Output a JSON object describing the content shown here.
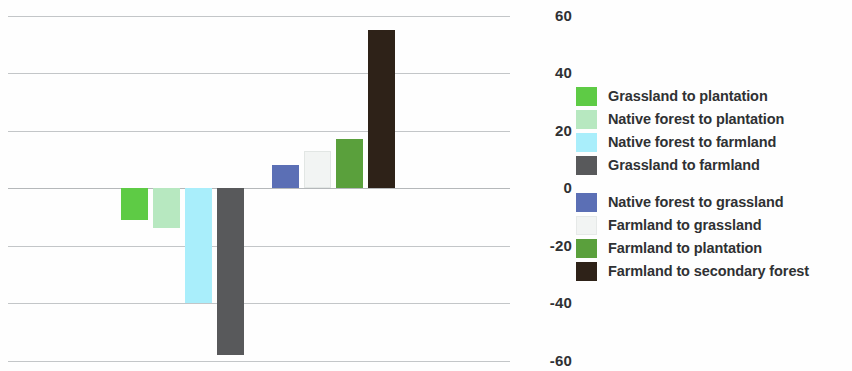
{
  "chart_data": {
    "type": "bar",
    "title": "",
    "subtitle": "",
    "xlabel": "",
    "ylabel": "",
    "ylim": [
      -60,
      60
    ],
    "grid": true,
    "legend_position": "right",
    "y_ticks": [
      "60",
      "40",
      "20",
      "0",
      "-20",
      "-40",
      "-60"
    ],
    "y_tick_values": [
      60,
      40,
      20,
      0,
      -20,
      -40,
      -60
    ],
    "categories": [
      "Grassland to plantation",
      "Native forest to plantation",
      "Native forest to farmland",
      "Grassland to farmland",
      "Native forest to grassland",
      "Farmland to grassland",
      "Farmland to plantation",
      "Farmland to secondary forest"
    ],
    "values": [
      -11,
      -14,
      -40,
      -58,
      8,
      13,
      17,
      55
    ],
    "colors": [
      "#5ecb45",
      "#b7e8c0",
      "#a9eefb",
      "#58595b",
      "#5b6fb5",
      "#f2f4f3",
      "#5aa03c",
      "#2e2218"
    ],
    "bars": [
      {
        "label": "Grassland to plantation",
        "value": -11,
        "color": "#5ecb45"
      },
      {
        "label": "Native forest to plantation",
        "value": -14,
        "color": "#b7e8c0"
      },
      {
        "label": "Native forest to farmland",
        "value": -40,
        "color": "#a9eefb"
      },
      {
        "label": "Grassland to farmland",
        "value": -58,
        "color": "#58595b"
      },
      {
        "label": "Native forest to grassland",
        "value": 8,
        "color": "#5b6fb5"
      },
      {
        "label": "Farmland to grassland",
        "value": 13,
        "color": "#f2f4f3"
      },
      {
        "label": "Farmland to plantation",
        "value": 17,
        "color": "#5aa03c"
      },
      {
        "label": "Farmland to secondary forest",
        "value": 55,
        "color": "#2e2218"
      }
    ]
  },
  "legend": {
    "group_1": [
      {
        "label": "Grassland to plantation",
        "color": "#5ecb45"
      },
      {
        "label": "Native forest to plantation",
        "color": "#b7e8c0"
      },
      {
        "label": "Native forest to farmland",
        "color": "#a9eefb"
      },
      {
        "label": "Grassland to farmland",
        "color": "#58595b"
      }
    ],
    "group_2": [
      {
        "label": "Native forest to grassland",
        "color": "#5b6fb5"
      },
      {
        "label": "Farmland to grassland",
        "color": "#f2f4f3"
      },
      {
        "label": "Farmland to plantation",
        "color": "#5aa03c"
      },
      {
        "label": "Farmland to secondary forest",
        "color": "#2e2218"
      }
    ]
  },
  "axis": {
    "y_labels": [
      "60",
      "40",
      "20",
      "0",
      "-20",
      "-40",
      "-60"
    ]
  }
}
